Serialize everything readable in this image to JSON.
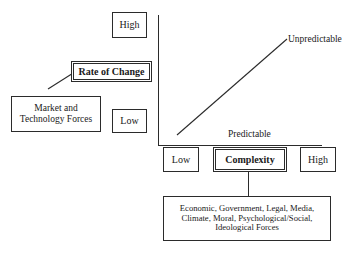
{
  "diagram": {
    "axes": {
      "vertical": {
        "name": "Rate of Change",
        "high_label": "High",
        "low_label": "Low"
      },
      "horizontal": {
        "name": "Complexity",
        "low_label": "Low",
        "high_label": "High"
      }
    },
    "trend_line": {
      "upper_label": "Unpredictable",
      "lower_label": "Predictable"
    },
    "boxes": {
      "vertical_high": "High",
      "vertical_low": "Low",
      "rate_of_change": "Rate of Change",
      "market_forces_line1": "Market and",
      "market_forces_line2": "Technology Forces",
      "horizontal_low": "Low",
      "complexity": "Complexity",
      "horizontal_high": "High",
      "forces_list_line1": "Economic, Government, Legal, Media,",
      "forces_list_line2": "Climate, Moral, Psychological/Social,",
      "forces_list_line3": "Ideological Forces"
    },
    "colors": {
      "stroke": "#2b2b2b",
      "text": "#1a1a1a",
      "background": "#ffffff"
    }
  }
}
